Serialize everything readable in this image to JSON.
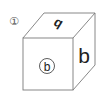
{
  "figure": {
    "number_label": "①",
    "cube": {
      "top_face_glyph": "b",
      "top_face_glyph_note": "rotated/mirrored b",
      "front_face_glyph": "b",
      "front_face_circled": true,
      "right_face_glyph": "b"
    },
    "colors": {
      "line": "#7a7a7a",
      "text": "#222222"
    }
  }
}
